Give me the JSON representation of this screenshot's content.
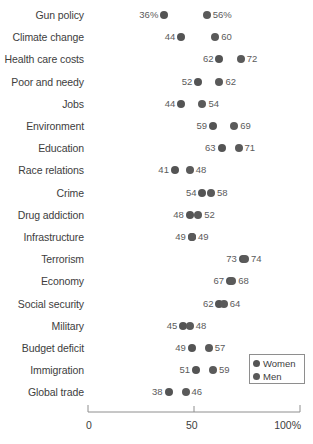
{
  "chart_data": {
    "type": "scatter",
    "title": "",
    "subtitle": "",
    "xlabel": "",
    "ylabel": "",
    "xlim": [
      0,
      100
    ],
    "grid": false,
    "legend_position": "bottom-right",
    "x_ticks": [
      {
        "value": 0,
        "label": "0"
      },
      {
        "value": 50,
        "label": "50"
      },
      {
        "value": 100,
        "label": "100%"
      }
    ],
    "legend": [
      {
        "name": "Women",
        "color": "#545454"
      },
      {
        "name": "Men",
        "color": "#5a5a5a"
      }
    ],
    "series": [
      {
        "name": "Women",
        "values": [
          36,
          44,
          62,
          52,
          44,
          59,
          63,
          41,
          54,
          48,
          49,
          73,
          67,
          62,
          45,
          49,
          51,
          38
        ]
      },
      {
        "name": "Men",
        "values": [
          56,
          60,
          72,
          62,
          54,
          69,
          71,
          48,
          58,
          52,
          49,
          74,
          68,
          64,
          48,
          57,
          59,
          46
        ]
      }
    ],
    "categories": [
      "Gun policy",
      "Climate change",
      "Health care costs",
      "Poor and needy",
      "Jobs",
      "Environment",
      "Education",
      "Race relations",
      "Crime",
      "Drug addiction",
      "Infrastructure",
      "Terrorism",
      "Economy",
      "Social security",
      "Military",
      "Budget deficit",
      "Immigration",
      "Global trade"
    ],
    "rows": [
      {
        "category": "Gun policy",
        "women": 36,
        "men": 56,
        "women_label": "36%",
        "men_label": "56%"
      },
      {
        "category": "Climate change",
        "women": 44,
        "men": 60,
        "women_label": "44",
        "men_label": "60"
      },
      {
        "category": "Health care costs",
        "women": 62,
        "men": 72,
        "women_label": "62",
        "men_label": "72"
      },
      {
        "category": "Poor and needy",
        "women": 52,
        "men": 62,
        "women_label": "52",
        "men_label": "62"
      },
      {
        "category": "Jobs",
        "women": 44,
        "men": 54,
        "women_label": "44",
        "men_label": "54"
      },
      {
        "category": "Environment",
        "women": 59,
        "men": 69,
        "women_label": "59",
        "men_label": "69"
      },
      {
        "category": "Education",
        "women": 63,
        "men": 71,
        "women_label": "63",
        "men_label": "71"
      },
      {
        "category": "Race relations",
        "women": 41,
        "men": 48,
        "women_label": "41",
        "men_label": "48"
      },
      {
        "category": "Crime",
        "women": 54,
        "men": 58,
        "women_label": "54",
        "men_label": "58"
      },
      {
        "category": "Drug addiction",
        "women": 48,
        "men": 52,
        "women_label": "48",
        "men_label": "52"
      },
      {
        "category": "Infrastructure",
        "women": 49,
        "men": 49,
        "women_label": "49",
        "men_label": "49"
      },
      {
        "category": "Terrorism",
        "women": 73,
        "men": 74,
        "women_label": "73",
        "men_label": "74"
      },
      {
        "category": "Economy",
        "women": 67,
        "men": 68,
        "women_label": "67",
        "men_label": "68"
      },
      {
        "category": "Social security",
        "women": 62,
        "men": 64,
        "women_label": "62",
        "men_label": "64"
      },
      {
        "category": "Military",
        "women": 45,
        "men": 48,
        "women_label": "45",
        "men_label": "48"
      },
      {
        "category": "Budget deficit",
        "women": 49,
        "men": 57,
        "women_label": "49",
        "men_label": "57"
      },
      {
        "category": "Immigration",
        "women": 51,
        "men": 59,
        "women_label": "51",
        "men_label": "59"
      },
      {
        "category": "Global trade",
        "women": 38,
        "men": 46,
        "women_label": "38",
        "men_label": "46"
      }
    ]
  },
  "layout": {
    "plot_left_px": 88,
    "plot_right_px": 300,
    "first_row_center_y": 15,
    "row_step_y": 22.2,
    "axis_y": 412
  }
}
